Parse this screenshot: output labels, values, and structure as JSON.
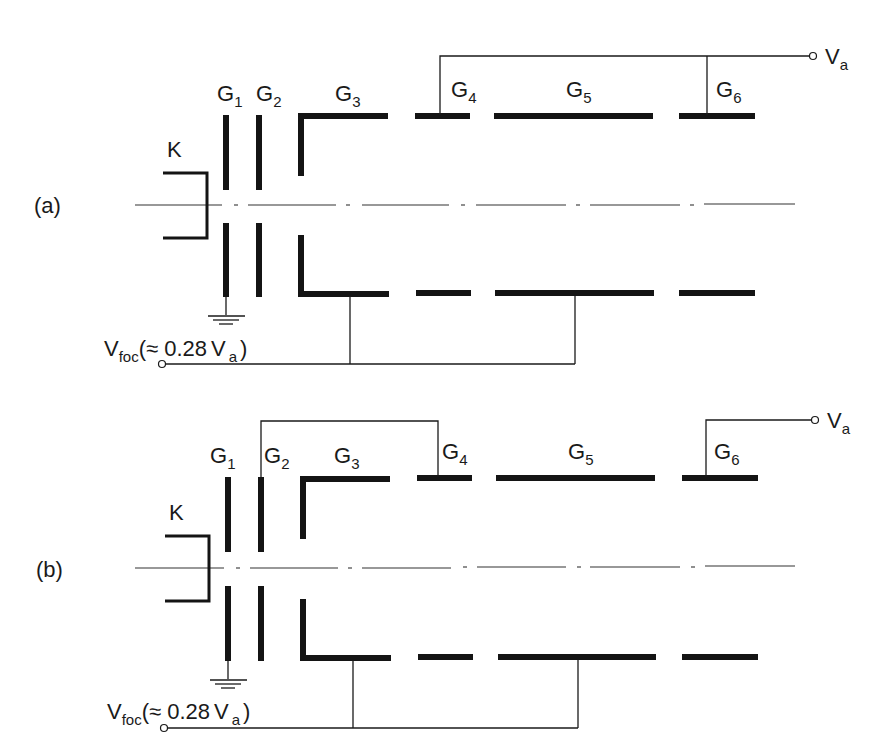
{
  "figure": {
    "panels": [
      {
        "id": "a",
        "label": "(a)",
        "cathode_label": "K",
        "electrodes": [
          {
            "name": "G",
            "sub": "1"
          },
          {
            "name": "G",
            "sub": "2"
          },
          {
            "name": "G",
            "sub": "3"
          },
          {
            "name": "G",
            "sub": "4"
          },
          {
            "name": "G",
            "sub": "5"
          },
          {
            "name": "G",
            "sub": "6"
          }
        ],
        "anode_terminal": {
          "name": "V",
          "sub": "a"
        },
        "focus_terminal": {
          "name": "V",
          "sub": "foc",
          "paren_open": "(",
          "approx": "≈ 0.28",
          "ref": "V",
          "ref_sub": "a",
          "paren_close": ")"
        },
        "connections": {
          "anode": [
            "G4",
            "G6"
          ],
          "focus": [
            "G3",
            "G5"
          ],
          "ground": [
            "G1"
          ]
        }
      },
      {
        "id": "b",
        "label": "(b)",
        "cathode_label": "K",
        "electrodes": [
          {
            "name": "G",
            "sub": "1"
          },
          {
            "name": "G",
            "sub": "2"
          },
          {
            "name": "G",
            "sub": "3"
          },
          {
            "name": "G",
            "sub": "4"
          },
          {
            "name": "G",
            "sub": "5"
          },
          {
            "name": "G",
            "sub": "6"
          }
        ],
        "anode_terminal": {
          "name": "V",
          "sub": "a"
        },
        "focus_terminal": {
          "name": "V",
          "sub": "foc",
          "paren_open": "(",
          "approx": "≈ 0.28",
          "ref": "V",
          "ref_sub": "a",
          "paren_close": ")"
        },
        "connections": {
          "anode": [
            "G6"
          ],
          "g2_g4_link": [
            "G2",
            "G4"
          ],
          "focus": [
            "G3",
            "G5"
          ],
          "ground": [
            "G1"
          ]
        }
      }
    ]
  }
}
